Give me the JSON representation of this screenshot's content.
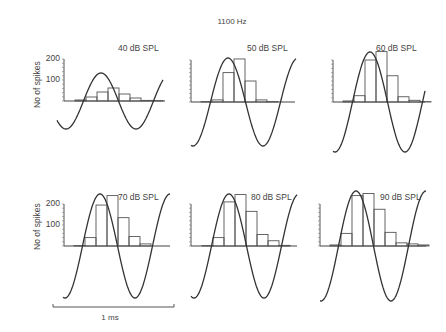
{
  "title": "1100 Hz",
  "ylabel": "No of spikes",
  "scalebar_label": "1 ms",
  "chart_data": [
    {
      "type": "bar",
      "title": "40 dB SPL",
      "ylabel": "No of spikes",
      "yticks": [
        100,
        200
      ],
      "ylim": [
        0,
        200
      ],
      "bin_values": [
        5,
        20,
        45,
        65,
        35,
        15,
        3,
        2
      ],
      "overlay": "sinusoid (stimulus waveform), small amplitude"
    },
    {
      "type": "bar",
      "title": "50 dB SPL",
      "ylim": [
        0,
        200
      ],
      "bin_values": [
        2,
        10,
        140,
        205,
        100,
        10,
        2
      ],
      "overlay": "sinusoid"
    },
    {
      "type": "bar",
      "title": "60 dB SPL",
      "ylim": [
        0,
        200
      ],
      "bin_values": [
        5,
        30,
        200,
        240,
        125,
        25,
        8,
        2
      ],
      "overlay": "sinusoid"
    },
    {
      "type": "bar",
      "title": "70 dB SPL",
      "ylabel": "No of spikes",
      "yticks": [
        100,
        200
      ],
      "ylim": [
        0,
        200
      ],
      "bin_values": [
        2,
        40,
        195,
        240,
        135,
        45,
        10
      ],
      "overlay": "sinusoid"
    },
    {
      "type": "bar",
      "title": "80 dB SPL",
      "ylim": [
        0,
        200
      ],
      "bin_values": [
        2,
        40,
        210,
        245,
        165,
        55,
        25,
        3
      ],
      "overlay": "sinusoid"
    },
    {
      "type": "bar",
      "title": "90 dB SPL",
      "ylim": [
        0,
        200
      ],
      "bin_values": [
        5,
        60,
        240,
        250,
        175,
        65,
        15,
        10,
        5
      ],
      "overlay": "sinusoid"
    }
  ],
  "panels": [
    {
      "label": "40 dB SPL",
      "show_ticks_labels": true
    },
    {
      "label": "50 dB SPL",
      "show_ticks_labels": false
    },
    {
      "label": "60 dB SPL",
      "show_ticks_labels": false
    },
    {
      "label": "70 dB SPL",
      "show_ticks_labels": true
    },
    {
      "label": "80 dB SPL",
      "show_ticks_labels": false
    },
    {
      "label": "90 dB SPL",
      "show_ticks_labels": false
    }
  ],
  "tick_labels": {
    "t200": "200",
    "t100": "100"
  }
}
